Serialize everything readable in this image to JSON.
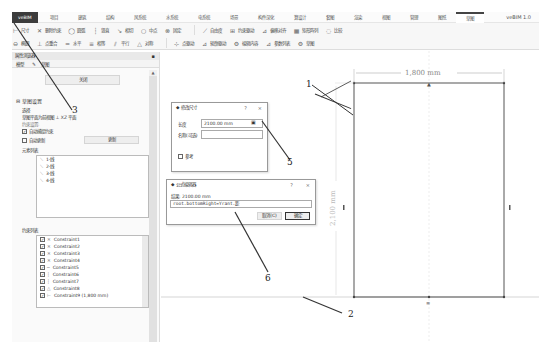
{
  "ribbon": {
    "file_tab": "veBIM",
    "tabs": [
      "项目",
      "建筑",
      "结构",
      "风系统",
      "水系统",
      "电系统",
      "场景",
      "构件深化",
      "算设计",
      "套图",
      "渲染",
      "视图",
      "管理",
      "图纸",
      "草图"
    ],
    "active_tab_index": 14,
    "app_name": "veBIM 1.0",
    "row1": [
      {
        "icon": "dimension-icon",
        "label": "尺寸"
      },
      {
        "icon": "delete-icon",
        "label": "删除约束"
      },
      {
        "icon": "circle-icon",
        "label": "圆弧"
      },
      {
        "icon": "vertical-icon",
        "label": "竖直"
      },
      {
        "icon": "tangent-icon",
        "label": "相切"
      },
      {
        "icon": "midpoint-icon",
        "label": "中点"
      },
      {
        "icon": "fix-icon",
        "label": "固定"
      },
      {
        "icon": "trim-icon",
        "label": "自由度"
      },
      {
        "icon": "dimension-driven-icon",
        "label": "约束驱动"
      },
      {
        "icon": "mirror-icon",
        "label": "偏移对齐"
      },
      {
        "icon": "array-icon",
        "label": "矩形阵列"
      },
      {
        "icon": "offset-icon",
        "label": "比较"
      }
    ],
    "row2": [
      {
        "icon": "ellipse-icon",
        "label": "椭圆"
      },
      {
        "icon": "coincident-icon",
        "label": "点重合"
      },
      {
        "icon": "horizontal-icon",
        "label": "水平"
      },
      {
        "icon": "equal-icon",
        "label": "相等"
      },
      {
        "icon": "parallel-icon",
        "label": "平行"
      },
      {
        "icon": "symmetric-icon",
        "label": "对称"
      },
      {
        "icon": "point-icon",
        "label": "点驱动"
      },
      {
        "icon": "shape-icon",
        "label": "轮廓驱动"
      },
      {
        "icon": "edit-icon",
        "label": "编辑内容"
      },
      {
        "icon": "param-icon",
        "label": "参数列表"
      },
      {
        "icon": "settings-icon",
        "label": "草图"
      }
    ]
  },
  "panel": {
    "title": "属性浏览器",
    "tabs": [
      "模型",
      "草图"
    ],
    "close_button": "关闭",
    "section_title": "草图设置",
    "reference_label": "选择",
    "workplane_text": "草图平面为前视图",
    "workplane_value": "XZ 平面",
    "constraint_label": "约束设置:",
    "auto_constraint": {
      "label": "自动捕捉约束",
      "checked": true
    },
    "auto_update": {
      "label": "自动更新",
      "checked": false
    },
    "update_button": "更新",
    "elements_title": "元素列表",
    "elements": [
      "1-线",
      "2-线",
      "3-线",
      "4-线"
    ],
    "constraints_title": "约束列表",
    "constraints": [
      {
        "label": "Constraint1",
        "checked": true
      },
      {
        "label": "Constraint2",
        "checked": true
      },
      {
        "label": "Constraint3",
        "checked": true
      },
      {
        "label": "Constraint4",
        "checked": true
      },
      {
        "label": "Constraint5",
        "checked": true
      },
      {
        "label": "Constraint6",
        "checked": true
      },
      {
        "label": "Constraint7",
        "checked": true
      },
      {
        "label": "Constraint8",
        "checked": true
      },
      {
        "label": "Constraint9 (1,800 mm)",
        "checked": true
      }
    ]
  },
  "dimension_dialog": {
    "title": "修改尺寸",
    "length_label": "长度",
    "length_value": "2100.00 mm",
    "name_label": "名称(可选)",
    "name_value": "",
    "reference_label": "参考",
    "reference_checked": false,
    "help": "?",
    "close": "×"
  },
  "formula_dialog": {
    "title": "公式编辑器",
    "result_label": "结果: 2100.00 mm",
    "formula_value": "root.bottomRight=Yrant.距",
    "cancel_button": "取消(C)",
    "ok_button": "确定",
    "help": "?",
    "close": "×"
  },
  "drawing": {
    "width_dimension": "1,800 mm",
    "height_dimension": "2,100 mm"
  },
  "callouts": [
    "1",
    "2",
    "3",
    "5",
    "6"
  ]
}
